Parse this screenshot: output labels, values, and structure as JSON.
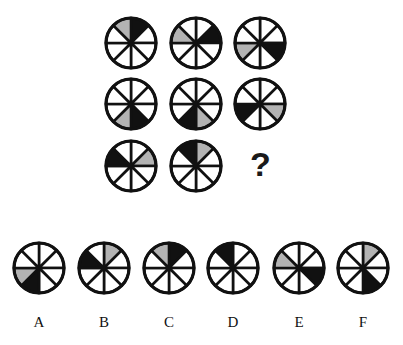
{
  "puzzle": {
    "question_mark": "?",
    "segment_convention": "8 segments clockwise from 12 o'clock; index 0 = 12:00-1:30",
    "colors": {
      "black": "#111111",
      "gray": "#b3b3b3",
      "white": "#ffffff",
      "stroke": "#111111"
    },
    "grid": [
      {
        "id": "r1c1",
        "black": 0,
        "gray": 7
      },
      {
        "id": "r1c2",
        "black": 1,
        "gray": 6
      },
      {
        "id": "r1c3",
        "black": 2,
        "gray": 5
      },
      {
        "id": "r2c1",
        "black": 3,
        "gray": 4
      },
      {
        "id": "r2c2",
        "black": 4,
        "gray": 3
      },
      {
        "id": "r2c3",
        "black": 5,
        "gray": 2
      },
      {
        "id": "r3c1",
        "black": 6,
        "gray": 1
      },
      {
        "id": "r3c2",
        "black": 7,
        "gray": 0
      }
    ],
    "options": [
      {
        "label": "A",
        "black": 4,
        "gray": 5
      },
      {
        "label": "B",
        "black": 6,
        "gray": 0
      },
      {
        "label": "C",
        "black": 0,
        "gray": 7
      },
      {
        "label": "D",
        "black": 7,
        "gray": null
      },
      {
        "label": "E",
        "black": 2,
        "gray": 6
      },
      {
        "label": "F",
        "black": 3,
        "gray": 0
      }
    ]
  }
}
